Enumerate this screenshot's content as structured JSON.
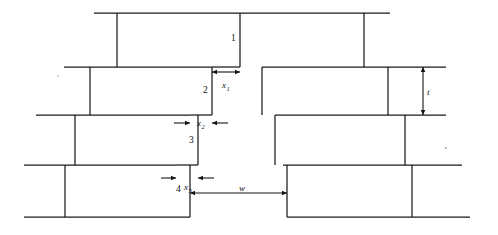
{
  "figure": {
    "type": "engineering-line-diagram",
    "canvas": {
      "width": 498,
      "height": 235
    },
    "ink_color": "#1a1a1a",
    "background_color": "#ffffff"
  },
  "course_labels": [
    {
      "id": "course-1",
      "text": "1",
      "x": 231,
      "y": 41
    },
    {
      "id": "course-2",
      "text": "2",
      "x": 203,
      "y": 93
    },
    {
      "id": "course-3",
      "text": "3",
      "x": 189,
      "y": 143
    },
    {
      "id": "course-4",
      "text": "4",
      "x": 176,
      "y": 192
    }
  ],
  "dimensions": [
    {
      "id": "x1",
      "symbol": "x",
      "subscript": "1",
      "orientation": "horizontal",
      "arrow_style": "inward",
      "y": 72,
      "x_start": 212,
      "x_end": 240,
      "label_x": 222,
      "label_y": 88
    },
    {
      "id": "x2",
      "symbol": "x",
      "subscript": "2",
      "orientation": "horizontal",
      "arrow_style": "outward",
      "y": 123,
      "x_start": 190,
      "x_end": 212,
      "lead_left": 174,
      "lead_right": 228,
      "label_x": 197,
      "label_y": 126
    },
    {
      "id": "x3",
      "symbol": "x",
      "subscript": "3",
      "orientation": "horizontal",
      "arrow_style": "outward",
      "y": 178,
      "x_start": 176,
      "x_end": 198,
      "lead_left": 161,
      "lead_right": 214,
      "label_x": 184,
      "label_y": 190
    },
    {
      "id": "w",
      "symbol": "w",
      "subscript": "",
      "orientation": "horizontal",
      "arrow_style": "inward",
      "y": 193,
      "x_start": 190,
      "x_end": 287,
      "label_x": 239,
      "label_y": 191
    },
    {
      "id": "t",
      "symbol": "t",
      "subscript": "",
      "orientation": "vertical",
      "arrow_style": "inward",
      "x": 423,
      "y_start": 67,
      "y_end": 115,
      "label_x": 427,
      "label_y": 95
    }
  ],
  "geometry": {
    "horizontal_lines": [
      {
        "id": "h-top-left",
        "x1": 94,
        "x2": 240,
        "y": 13
      },
      {
        "id": "h-top-right",
        "x1": 240,
        "x2": 390,
        "y": 13
      },
      {
        "id": "h-c1-c2-left",
        "x1": 64,
        "x2": 212,
        "y": 67
      },
      {
        "id": "h-c1-c2-mid",
        "x1": 212,
        "x2": 240,
        "y": 67
      },
      {
        "id": "h-c1-c2-right",
        "x1": 262,
        "x2": 446,
        "y": 67
      },
      {
        "id": "h-c2-c3-left",
        "x1": 36,
        "x2": 190,
        "y": 115
      },
      {
        "id": "h-c2-c3-midleft",
        "x1": 190,
        "x2": 212,
        "y": 115
      },
      {
        "id": "h-c2-c3-right",
        "x1": 275,
        "x2": 446,
        "y": 115
      },
      {
        "id": "h-c3-c4-left",
        "x1": 24,
        "x2": 176,
        "y": 165
      },
      {
        "id": "h-c3-c4-midleft",
        "x1": 176,
        "x2": 198,
        "y": 165
      },
      {
        "id": "h-c3-c4-right",
        "x1": 283,
        "x2": 462,
        "y": 165
      },
      {
        "id": "h-bot-left",
        "x1": 24,
        "x2": 190,
        "y": 217
      },
      {
        "id": "h-bot-right",
        "x1": 287,
        "x2": 470,
        "y": 217
      }
    ],
    "vertical_lines": [
      {
        "id": "v-c1-left",
        "x": 117,
        "y1": 13,
        "y2": 67
      },
      {
        "id": "v-c1-crackface",
        "x": 240,
        "y1": 13,
        "y2": 67
      },
      {
        "id": "v-c1-right",
        "x": 364,
        "y1": 13,
        "y2": 67
      },
      {
        "id": "v-c2-left",
        "x": 90,
        "y1": 67,
        "y2": 115
      },
      {
        "id": "v-c2-crackface",
        "x": 212,
        "y1": 67,
        "y2": 115
      },
      {
        "id": "v-c2-rightedge",
        "x": 262,
        "y1": 67,
        "y2": 115
      },
      {
        "id": "v-c2-right",
        "x": 388,
        "y1": 67,
        "y2": 115
      },
      {
        "id": "v-c3-left",
        "x": 75,
        "y1": 115,
        "y2": 165
      },
      {
        "id": "v-c3-crackface",
        "x": 198,
        "y1": 115,
        "y2": 165
      },
      {
        "id": "v-c3-rightedge",
        "x": 275,
        "y1": 115,
        "y2": 165
      },
      {
        "id": "v-c3-right",
        "x": 405,
        "y1": 115,
        "y2": 165
      },
      {
        "id": "v-c4-left",
        "x": 65,
        "y1": 165,
        "y2": 217
      },
      {
        "id": "v-c4-crackface",
        "x": 190,
        "y1": 165,
        "y2": 217
      },
      {
        "id": "v-c4-rightedge",
        "x": 287,
        "y1": 165,
        "y2": 217
      },
      {
        "id": "v-c4-right",
        "x": 412,
        "y1": 165,
        "y2": 217
      }
    ]
  },
  "specks": [
    {
      "id": "speck-right",
      "x": 446,
      "y": 148,
      "r": 0.9
    },
    {
      "id": "speck-left",
      "x": 58,
      "y": 76,
      "r": 0.7
    }
  ]
}
